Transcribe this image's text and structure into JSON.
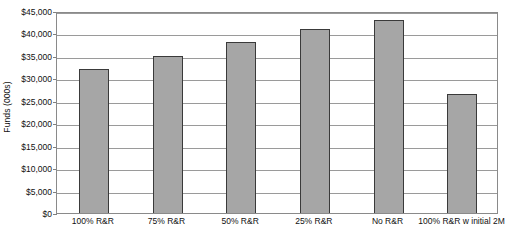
{
  "chart_data": {
    "type": "bar",
    "title": "",
    "subtitle": "",
    "xlabel": "",
    "ylabel": "Funds (000s)",
    "categories": [
      "100% R&R",
      "75% R&R",
      "50% R&R",
      "25% R&R",
      "No R&R",
      "100% R&R w initial 2M"
    ],
    "values": [
      32000,
      35000,
      38000,
      41000,
      43000,
      26500
    ],
    "ylim": [
      0,
      45000
    ],
    "ytick_values": [
      0,
      5000,
      10000,
      15000,
      20000,
      25000,
      30000,
      35000,
      40000,
      45000
    ],
    "ytick_labels": [
      "$0",
      "$5,000",
      "$10,000",
      "$15,000",
      "$20,000",
      "$25,000",
      "$30,000",
      "$35,000",
      "$40,000",
      "$45,000"
    ],
    "grid": true,
    "grid_axis": "y",
    "legend": false,
    "legend_position": "none",
    "bar_color": "#a6a6a6",
    "bar_edge_color": "#3a3a3a",
    "grid_color": "#9a9a9a",
    "frame_color": "#8a8a8a",
    "background_color": "#ffffff",
    "text_color": "#111111"
  }
}
